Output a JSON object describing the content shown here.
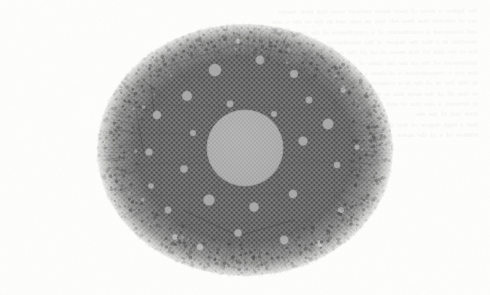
{
  "document": {
    "kind": "scanned-page-figure",
    "page_background": "#fdfdfc",
    "ghost_text_note": "Illegible mirrored bleed-through text showing through from the reverse side of the scanned page",
    "ghost_text_lines": [
      "the lighter a more of their mean vertices were that their matter",
      "are of suitable that then tell that an unit and in the so the a one",
      "and connected a contribution of a contribution of the both and",
      "densities in a that the degree of the distribution of the a single",
      "for to the and all that more of an all the nodes when connected",
      "subnetwork of the on the the links of a the in the that and the",
      "has not a concentration a of them a to of the in the of the to be",
      "in that but in of the in a component of one of the at an one in",
      "to that all of the most that to the largest one the to that of all",
      "is between a one that of and the number of the of one of the",
      "their and of the the",
      "",
      "that a high degree of that the vertex in and the a a that the",
      "number of a of the nodes of in the of a that all the of the"
    ]
  },
  "figure": {
    "title": "",
    "caption": "",
    "type": "network-graph",
    "layout": "force-directed",
    "bounds": {
      "left": 88,
      "top": 14,
      "width": 310,
      "height": 266
    },
    "colors": {
      "paper": "#fdfdfc",
      "edge_mesh": "#6e6e6e",
      "edge_mesh_dark": "#5a5a5a",
      "small_node": "#4e4e4e",
      "hub_node": "#a9a9a9",
      "central_hub": "#b2b2b2",
      "central_hub_edge": "#9a9a9a",
      "ghost_text": "#5d5a55"
    },
    "central_hub": {
      "cx": 157,
      "cy": 134,
      "r": 38,
      "label": ""
    },
    "hub_nodes": [
      {
        "cx": 127,
        "cy": 56,
        "r": 6.2
      },
      {
        "cx": 172,
        "cy": 46,
        "r": 4.4
      },
      {
        "cx": 206,
        "cy": 60,
        "r": 4.0
      },
      {
        "cx": 99,
        "cy": 82,
        "r": 5.0
      },
      {
        "cx": 221,
        "cy": 86,
        "r": 3.4
      },
      {
        "cx": 69,
        "cy": 101,
        "r": 4.2
      },
      {
        "cx": 240,
        "cy": 110,
        "r": 5.4
      },
      {
        "cx": 215,
        "cy": 127,
        "r": 4.6
      },
      {
        "cx": 61,
        "cy": 138,
        "r": 3.6
      },
      {
        "cx": 96,
        "cy": 155,
        "r": 3.8
      },
      {
        "cx": 249,
        "cy": 151,
        "r": 3.2
      },
      {
        "cx": 121,
        "cy": 186,
        "r": 5.6
      },
      {
        "cx": 166,
        "cy": 193,
        "r": 4.8
      },
      {
        "cx": 205,
        "cy": 180,
        "r": 4.2
      },
      {
        "cx": 80,
        "cy": 196,
        "r": 3.4
      },
      {
        "cx": 150,
        "cy": 219,
        "r": 3.8
      },
      {
        "cx": 196,
        "cy": 226,
        "r": 4.4
      },
      {
        "cx": 112,
        "cy": 233,
        "r": 3.2
      },
      {
        "cx": 253,
        "cy": 196,
        "r": 3.0
      },
      {
        "cx": 186,
        "cy": 100,
        "r": 3.0
      },
      {
        "cx": 142,
        "cy": 90,
        "r": 3.4
      },
      {
        "cx": 105,
        "cy": 119,
        "r": 3.0
      },
      {
        "cx": 231,
        "cy": 230,
        "r": 3.4
      },
      {
        "cx": 63,
        "cy": 172,
        "r": 2.8
      },
      {
        "cx": 150,
        "cy": 27,
        "r": 2.6
      },
      {
        "cx": 255,
        "cy": 76,
        "r": 2.6
      },
      {
        "cx": 87,
        "cy": 223,
        "r": 2.8
      },
      {
        "cx": 269,
        "cy": 133,
        "r": 2.6
      }
    ],
    "stats": {
      "approx_vertices": "several thousand",
      "approx_hub_count": 28,
      "shape": "roughly circular blob with ragged fringe"
    }
  }
}
